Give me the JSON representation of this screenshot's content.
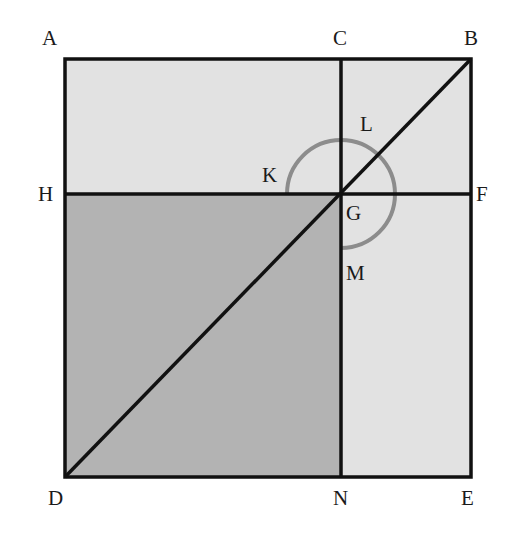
{
  "diagram": {
    "type": "geometry-square-gnomon",
    "colors": {
      "light_fill": "#e2e2e2",
      "dark_fill": "#b3b3b3",
      "line": "#111111",
      "arc": "#8c8c8c"
    },
    "points": {
      "A": "A",
      "C": "C",
      "B": "B",
      "H": "H",
      "G": "G",
      "F": "F",
      "D": "D",
      "N": "N",
      "E": "E",
      "K": "K",
      "L": "L",
      "M": "M"
    },
    "regions": [
      {
        "name": "square-ABED",
        "fill": "light"
      },
      {
        "name": "square-HGND",
        "fill": "dark"
      }
    ],
    "segments": [
      "AB",
      "BE",
      "ED",
      "DA",
      "CN",
      "HF",
      "DB"
    ],
    "arc": {
      "center": "G",
      "from": "K",
      "via": "L",
      "to": "M",
      "extent": "three-quarter-circle"
    }
  }
}
